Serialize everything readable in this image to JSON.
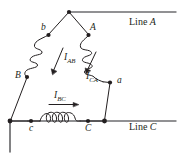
{
  "figure": {
    "background_color": "#ffffff",
    "stroke_color": "#231f20",
    "line_labels": [
      {
        "id": "line-a",
        "text_prefix": "Line ",
        "text_var": "A",
        "full": "Line A"
      },
      {
        "id": "line-c",
        "text_prefix": "Line ",
        "text_var": "C",
        "full": "Line C"
      }
    ],
    "node_labels": [
      {
        "id": "node-b-lower",
        "text": "b"
      },
      {
        "id": "node-a-upper",
        "text": "A"
      },
      {
        "id": "node-B-upper",
        "text": "B"
      },
      {
        "id": "node-a-lower",
        "text": "a"
      },
      {
        "id": "node-c-lower",
        "text": "c"
      },
      {
        "id": "node-c-upper",
        "text": "C"
      }
    ],
    "current_labels": [
      {
        "id": "current-iab",
        "symbol": "I",
        "sub": "AB",
        "full": "IAB"
      },
      {
        "id": "current-ica",
        "symbol": "I",
        "sub": "CA",
        "full": "ICA"
      },
      {
        "id": "current-ibc",
        "symbol": "I",
        "sub": "BC",
        "full": "IBC"
      }
    ],
    "coils": [
      {
        "id": "coil-left",
        "turns": 4,
        "orientation": "diagonal-down-left"
      },
      {
        "id": "coil-right",
        "turns": 4,
        "orientation": "diagonal-down-right"
      },
      {
        "id": "coil-bottom",
        "turns": 4,
        "orientation": "horizontal"
      }
    ]
  }
}
